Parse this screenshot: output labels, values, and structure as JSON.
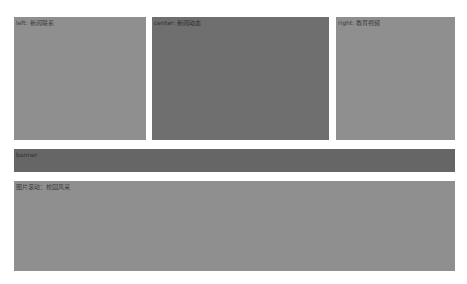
{
  "layout": {
    "top_row": [
      {
        "id": "left",
        "label": "left: 新闻联系",
        "color": "#8f8f8f"
      },
      {
        "id": "center",
        "label": "center: 新闻动态",
        "color": "#6f6f6f"
      },
      {
        "id": "right",
        "label": "right: 教育视频",
        "color": "#8f8f8f"
      }
    ],
    "banner": {
      "label": "banner",
      "color": "#666666"
    },
    "bottom": {
      "label": "图片滚动：校园风采",
      "color": "#8f8f8f"
    }
  }
}
